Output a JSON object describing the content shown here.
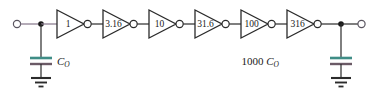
{
  "figure": {
    "type": "circuit-schematic",
    "width": 379,
    "height": 96,
    "background_color": "#ffffff",
    "wire_color": "#2b2b2b",
    "input_wire_color": "#8d7f92",
    "capacitor_plate_top_color": "#3f8d86",
    "capacitor_plate_bottom_color": "#6b5a66"
  },
  "chain": {
    "stage_count": 6,
    "stages": [
      {
        "index": 1,
        "label": "1",
        "size": 1
      },
      {
        "index": 2,
        "label": "3.16",
        "size": 3.16
      },
      {
        "index": 3,
        "label": "10",
        "size": 10
      },
      {
        "index": 4,
        "label": "31.6",
        "size": 31.6
      },
      {
        "index": 5,
        "label": "100",
        "size": 100
      },
      {
        "index": 6,
        "label": "316",
        "size": 316
      }
    ]
  },
  "input": {
    "terminal_name": "input-terminal",
    "node_name": "input-node"
  },
  "output": {
    "terminal_name": "output-terminal",
    "node_name": "output-node"
  },
  "capacitors": [
    {
      "id": "input-capacitor",
      "label_prefix": "",
      "label_symbol": "C",
      "label_subscript": "O",
      "label_text": "C_O"
    },
    {
      "id": "load-capacitor",
      "label_prefix": "1000 ",
      "label_symbol": "C",
      "label_subscript": "O",
      "label_text": "1000 C_O"
    }
  ]
}
